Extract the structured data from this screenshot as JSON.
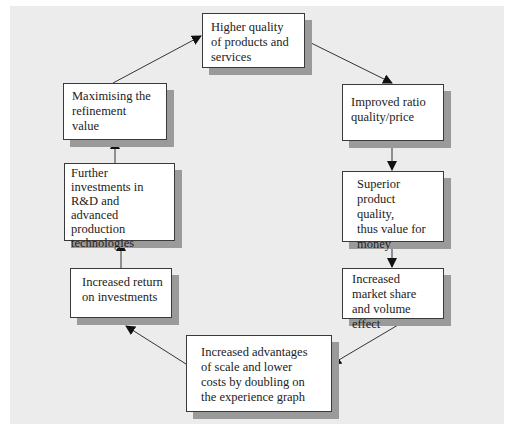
{
  "diagram": {
    "type": "cycle-flow",
    "nodes": [
      {
        "id": "higher-quality",
        "label": "Higher quality\nof products and\nservices"
      },
      {
        "id": "improved-ratio",
        "label": "Improved ratio\nquality/price"
      },
      {
        "id": "superior-quality",
        "label": "Superior\nproduct quality,\nthus value for\nmoney"
      },
      {
        "id": "market-share",
        "label": "Increased\nmarket share\nand volume effect"
      },
      {
        "id": "scale-advantages",
        "label": "Increased advantages\nof scale and lower\ncosts by doubling on\nthe experience graph"
      },
      {
        "id": "return-on-investments",
        "label": "Increased return\non investments"
      },
      {
        "id": "further-investments",
        "label": "Further\ninvestments in\nR&D and\nadvanced production\ntechnologies"
      },
      {
        "id": "maximising-value",
        "label": "Maximising the\nrefinement\nvalue"
      }
    ],
    "edges": [
      {
        "from": "higher-quality",
        "to": "improved-ratio"
      },
      {
        "from": "improved-ratio",
        "to": "superior-quality"
      },
      {
        "from": "superior-quality",
        "to": "market-share"
      },
      {
        "from": "market-share",
        "to": "scale-advantages"
      },
      {
        "from": "scale-advantages",
        "to": "return-on-investments"
      },
      {
        "from": "return-on-investments",
        "to": "further-investments"
      },
      {
        "from": "further-investments",
        "to": "maximising-value"
      },
      {
        "from": "maximising-value",
        "to": "higher-quality"
      }
    ]
  }
}
